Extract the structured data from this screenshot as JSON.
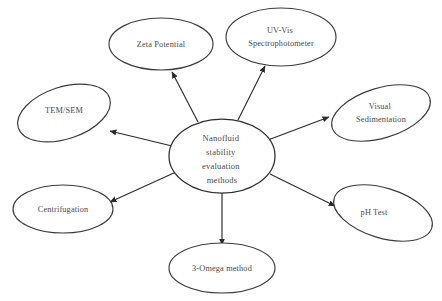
{
  "diagram": {
    "type": "hub-and-spoke",
    "title": "Nanofluid stability evaluation methods",
    "center": {
      "id": "center-node",
      "lines": [
        "Nanofluid",
        "stability",
        "evaluation",
        "methods"
      ]
    },
    "nodes": [
      {
        "id": "zeta-potential",
        "lines": [
          "Zeta Potential"
        ]
      },
      {
        "id": "uv-vis",
        "lines": [
          "UV-Vis",
          "Spectrophotometer"
        ]
      },
      {
        "id": "visual-sedimentation",
        "lines": [
          "Visual",
          "Sedimentation"
        ]
      },
      {
        "id": "ph-test",
        "lines": [
          "pH Test"
        ]
      },
      {
        "id": "three-omega",
        "lines": [
          "3-Omega method"
        ]
      },
      {
        "id": "centrifugation",
        "lines": [
          "Centrifugation"
        ]
      },
      {
        "id": "tem-sem",
        "lines": [
          "TEM/SEM"
        ]
      }
    ],
    "colors": {
      "background": "#ffffff",
      "stroke": "#2e2e2e",
      "text": "#4a4a4a"
    }
  }
}
